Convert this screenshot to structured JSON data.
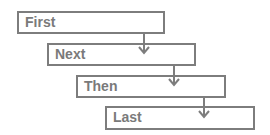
{
  "diagram": {
    "type": "sequential-step-flow",
    "colors": {
      "border": "#7d7d7d",
      "text": "#7a7a7a",
      "background": "#ffffff"
    },
    "steps": [
      {
        "label": "First"
      },
      {
        "label": "Next"
      },
      {
        "label": "Then"
      },
      {
        "label": "Last"
      }
    ],
    "connectors": [
      {
        "from": "First",
        "to": "Next",
        "icon": "arrow-down-icon"
      },
      {
        "from": "Next",
        "to": "Then",
        "icon": "arrow-down-icon"
      },
      {
        "from": "Then",
        "to": "Last",
        "icon": "arrow-down-icon"
      }
    ]
  }
}
